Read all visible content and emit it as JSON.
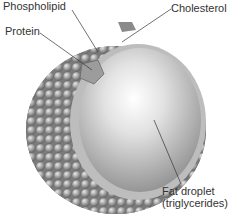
{
  "figure": {
    "labels": {
      "phospholipid": "Phospholipid",
      "cholesterol": "Cholesterol",
      "protein": "Protein",
      "fat_droplet_line1": "Fat droplet",
      "fat_droplet_line2": "(triglycerides)"
    },
    "colors": {
      "shell": "#8f8f8f",
      "core": "#d8d8d8",
      "leader_line": "#333333",
      "text": "#333333"
    }
  }
}
